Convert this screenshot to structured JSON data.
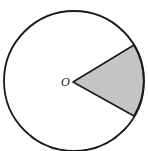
{
  "diagram": {
    "type": "circle-sector",
    "center_label": "O",
    "colors": {
      "stroke": "#1a1a1a",
      "sector_fill": "#c4c4c4",
      "background": "#ffffff"
    }
  }
}
